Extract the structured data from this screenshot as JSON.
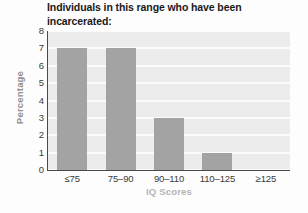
{
  "chart_data": {
    "type": "bar",
    "title": "Individuals in this range who have been\nincarcerated:",
    "xlabel": "IQ Scores",
    "ylabel": "Percentage",
    "categories": [
      "≤75",
      "75–90",
      "90–110",
      "110–125",
      "≥125"
    ],
    "values": [
      7,
      7,
      3,
      1,
      0
    ],
    "yticks": [
      "8",
      "7",
      "6",
      "5",
      "4",
      "3",
      "2",
      "1",
      "0"
    ],
    "ylim": [
      0,
      8
    ],
    "grid": true,
    "legend": false,
    "colors": {
      "bar": "#a3a3a3",
      "plot_background": "#ececec",
      "gridline": "#fbfbfb",
      "axis": "#4a4a4a",
      "title_text": "#1a1a1a",
      "tick_text": "#3b3b3b",
      "ylabel_text": "#8d8d8d",
      "xlabel_text": "#b4b4b4",
      "page_background": "#fdfdfd"
    }
  }
}
